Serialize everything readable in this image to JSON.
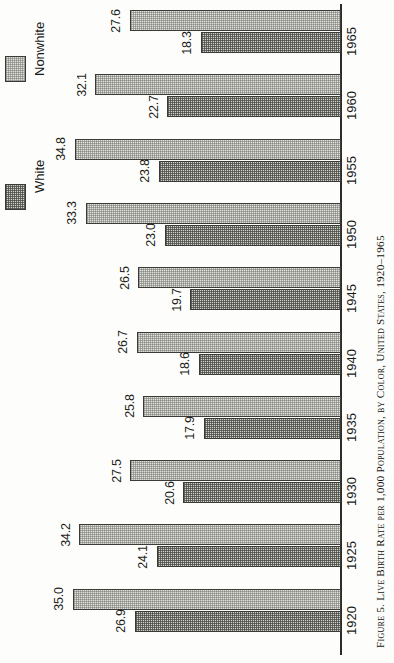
{
  "caption": {
    "text": "Figure 5. Live Birth Rate per 1,000 Population, by Color, United States, 1920–1965"
  },
  "legend": {
    "position": "top-left",
    "entries": [
      {
        "key": "nonwhite",
        "label": "Nonwhite",
        "swatch": "light-stipple"
      },
      {
        "key": "white",
        "label": "White",
        "swatch": "dark-checker"
      }
    ]
  },
  "axis": {
    "category_label": "",
    "value_label": "Live Birth Rate per 1,000 Population",
    "orientation": "horizontal-bars-rotated"
  },
  "groups": [
    {
      "year": "1965",
      "nonwhite": "27.6",
      "white": "18.3"
    },
    {
      "year": "1960",
      "nonwhite": "32.1",
      "white": "22.7"
    },
    {
      "year": "1955",
      "nonwhite": "34.8",
      "white": "23.8"
    },
    {
      "year": "1950",
      "nonwhite": "33.3",
      "white": "23.0"
    },
    {
      "year": "1945",
      "nonwhite": "26.5",
      "white": "19.7"
    },
    {
      "year": "1940",
      "nonwhite": "26.7",
      "white": "18.6"
    },
    {
      "year": "1935",
      "nonwhite": "25.8",
      "white": "17.9"
    },
    {
      "year": "1930",
      "nonwhite": "27.5",
      "white": "20.6"
    },
    {
      "year": "1925",
      "nonwhite": "34.2",
      "white": "24.1"
    },
    {
      "year": "1920",
      "nonwhite": "35.0",
      "white": "26.9"
    }
  ],
  "chart_data": {
    "type": "bar",
    "title": "Figure 5. Live Birth Rate per 1,000 Population, by Color, United States, 1920–1965",
    "orientation": "horizontal",
    "xlabel": "Live Birth Rate per 1,000 Population",
    "ylabel": "",
    "categories": [
      "1920",
      "1925",
      "1930",
      "1935",
      "1940",
      "1945",
      "1950",
      "1955",
      "1960",
      "1965"
    ],
    "series": [
      {
        "name": "Nonwhite",
        "values": [
          35.0,
          34.2,
          27.5,
          25.8,
          26.7,
          26.5,
          33.3,
          34.8,
          32.1,
          27.6
        ],
        "fill": "light-stipple",
        "color": "#e2e2de"
      },
      {
        "name": "White",
        "values": [
          26.9,
          24.1,
          20.6,
          17.9,
          18.6,
          19.7,
          23.0,
          23.8,
          22.7,
          18.3
        ],
        "fill": "dark-checker",
        "color": "#d2d2cd"
      }
    ],
    "xlim": [
      0,
      35.0
    ],
    "grid": false,
    "data_labels": true,
    "legend_position": "top-left",
    "colors": {
      "axis": "#2b2b28",
      "text": "#181815",
      "nonwhite_fill": "#e2e2de",
      "white_fill": "#d2d2cd",
      "bar_border": "#3a3a36",
      "background": "#fdfdfb"
    }
  }
}
